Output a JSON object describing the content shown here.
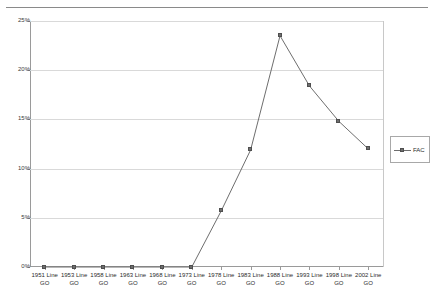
{
  "chart_data": {
    "type": "line",
    "title": "",
    "xlabel": "",
    "ylabel": "",
    "ylim": [
      0,
      25
    ],
    "ytick_labels": [
      "0%",
      "5%",
      "10%",
      "15%",
      "20%",
      "25%"
    ],
    "ytick_values": [
      0,
      5,
      10,
      15,
      20,
      25
    ],
    "grid": true,
    "legend_position": "right",
    "categories": [
      "1951 Line\nGO",
      "1953 Line\nGO",
      "1958 Line\nGO",
      "1963 Line\nGO",
      "1968 Line\nGO",
      "1973 Line\nGO",
      "1978 Line\nGO",
      "1983 Line\nGO",
      "1988 Line\nGO",
      "1993 Line\nGO",
      "1998 Line\nGO",
      "2002 Line\nGO"
    ],
    "series": [
      {
        "name": "FAC",
        "color": "#6e6e6e",
        "marker": "square",
        "values": [
          0,
          0,
          0,
          0,
          0,
          0,
          5.7,
          11.9,
          23.5,
          18.4,
          14.8,
          12.0
        ]
      }
    ]
  },
  "legend": {
    "entries": [
      {
        "label": "FAC"
      }
    ]
  },
  "axes": {
    "y_labels": [
      "25%",
      "20%",
      "15%",
      "10%",
      "5%",
      "0%"
    ]
  }
}
